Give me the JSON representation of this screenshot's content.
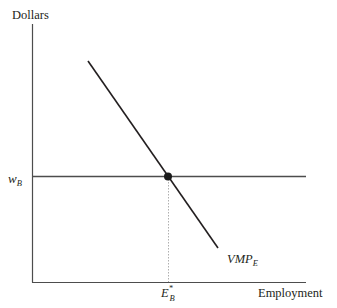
{
  "diagram": {
    "y_axis_label": "Dollars",
    "x_axis_label": "Employment",
    "wage_label": {
      "main": "w",
      "sub": "B"
    },
    "curve_label": {
      "main": "VMP",
      "sub": "E"
    },
    "equilibrium_label": {
      "main": "E",
      "sub": "B",
      "sup": "*"
    },
    "colors": {
      "axis": "#4d4d4d",
      "curve": "#231f20",
      "wage_line": "#4d4d4d",
      "dashed": "#8a8a8a",
      "point": "#1a1a1a"
    }
  }
}
